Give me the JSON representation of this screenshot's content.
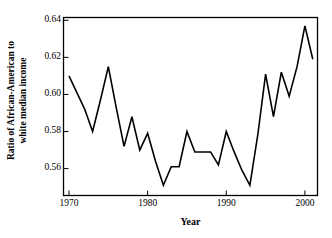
{
  "chart_data": {
    "type": "line",
    "title": "",
    "xlabel": "Year",
    "ylabel": "Ratio of African-American to white median income",
    "ylabel_line1": "Ratio of African-American to",
    "ylabel_line2": "white median income",
    "xlim": [
      1969.3,
      2001.6
    ],
    "ylim": [
      0.5455,
      0.6415
    ],
    "xticks": [
      1970,
      1980,
      1990,
      2000
    ],
    "xtick_labels": [
      "1970",
      "1980",
      "1990",
      "2000"
    ],
    "yticks": [
      0.56,
      0.58,
      0.6,
      0.62,
      0.64
    ],
    "ytick_labels": [
      "0.56",
      "0.58",
      "0.60",
      "0.62",
      "0.64"
    ],
    "grid": false,
    "legend": "none",
    "line_color": "#000000",
    "line_width": 1.6,
    "frame_color": "#000000",
    "x": [
      1970,
      1971,
      1972,
      1973,
      1974,
      1975,
      1976,
      1977,
      1978,
      1979,
      1980,
      1981,
      1982,
      1983,
      1984,
      1985,
      1986,
      1987,
      1988,
      1989,
      1990,
      1991,
      1992,
      1993,
      1994,
      1995,
      1996,
      1997,
      1998,
      1999,
      2000,
      2001
    ],
    "values": [
      0.61,
      0.601,
      0.592,
      0.58,
      0.597,
      0.615,
      0.593,
      0.572,
      0.588,
      0.57,
      0.579,
      0.564,
      0.551,
      0.561,
      0.561,
      0.58,
      0.569,
      0.569,
      0.569,
      0.562,
      0.58,
      0.569,
      0.559,
      0.551,
      0.578,
      0.611,
      0.588,
      0.612,
      0.599,
      0.615,
      0.637,
      0.619
    ],
    "series": [
      {
        "name": "Ratio of African-American to white median income",
        "values": [
          0.61,
          0.601,
          0.592,
          0.58,
          0.597,
          0.615,
          0.593,
          0.572,
          0.588,
          0.57,
          0.579,
          0.564,
          0.551,
          0.561,
          0.561,
          0.58,
          0.569,
          0.569,
          0.569,
          0.562,
          0.58,
          0.569,
          0.559,
          0.551,
          0.578,
          0.611,
          0.588,
          0.612,
          0.599,
          0.615,
          0.637,
          0.619
        ]
      }
    ]
  }
}
